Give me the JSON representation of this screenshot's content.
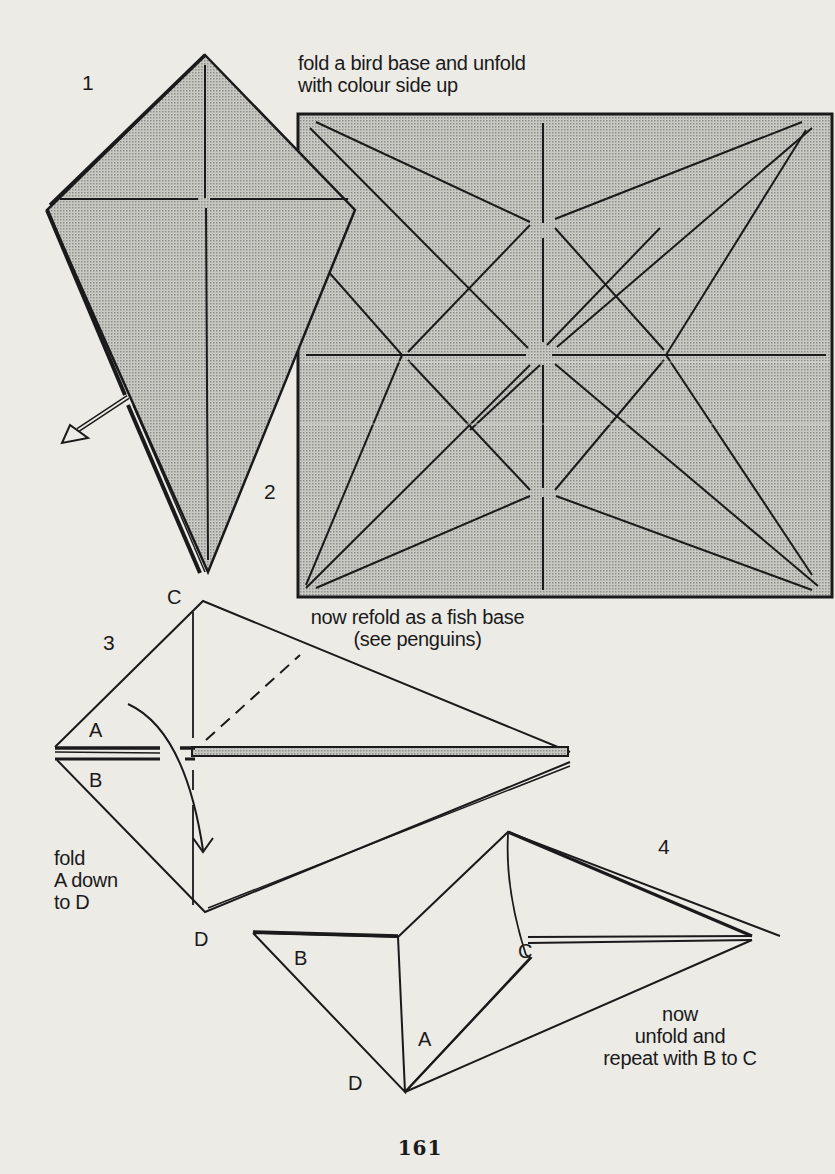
{
  "page": {
    "number": "161",
    "colors": {
      "paper": "#ecebe6",
      "ink": "#1a1a1a",
      "shaded_fill": "#b9b9b4"
    }
  },
  "steps": [
    {
      "id": 1,
      "label": "1",
      "diagram": "bird-base kite (colored side), arrow indicating unfold",
      "caption_lines": [
        "fold a bird base and unfold",
        "with colour side up"
      ]
    },
    {
      "id": 2,
      "label": "2",
      "diagram": "unfolded square showing bird base crease pattern",
      "caption_lines": [
        "now refold as a fish base",
        "(see penguins)"
      ]
    },
    {
      "id": 3,
      "label": "3",
      "diagram": "fish base with flaps A and B, valley fold line",
      "points": {
        "top": "C",
        "flap_upper": "A",
        "flap_lower": "B",
        "bottom": "D"
      },
      "caption_lines": [
        "fold",
        "A down",
        "to D"
      ]
    },
    {
      "id": 4,
      "label": "4",
      "diagram": "flap A folded down to D",
      "points": {
        "left": "B",
        "flap": "C",
        "folded": "A",
        "bottom": "D"
      },
      "caption_lines": [
        "now",
        "unfold and",
        "repeat with B to C"
      ]
    }
  ]
}
